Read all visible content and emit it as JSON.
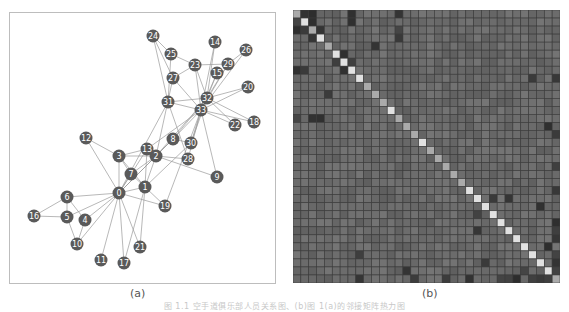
{
  "figure": {
    "caption": "图 1.1  空手道俱乐部人员关系图、(b)图 1(a)的邻接矩阵热力图",
    "panel_a_label": "(a)",
    "panel_b_label": "(b)"
  },
  "colors": {
    "node_fill": "#5a5a5a",
    "node_text": "#ffffff",
    "edge": "#9a9a9a",
    "frame": "#bdbdbd",
    "matrix_base": "#6a6a6a",
    "matrix_grid": "#3c3c3c"
  },
  "network": {
    "node_radius": 6.5,
    "nodes": [
      {
        "id": "0",
        "x": 118,
        "y": 192
      },
      {
        "id": "1",
        "x": 144,
        "y": 186
      },
      {
        "id": "2",
        "x": 155,
        "y": 155
      },
      {
        "id": "3",
        "x": 118,
        "y": 155
      },
      {
        "id": "4",
        "x": 84,
        "y": 219
      },
      {
        "id": "5",
        "x": 66,
        "y": 216
      },
      {
        "id": "6",
        "x": 66,
        "y": 196
      },
      {
        "id": "7",
        "x": 130,
        "y": 173
      },
      {
        "id": "8",
        "x": 172,
        "y": 138
      },
      {
        "id": "9",
        "x": 216,
        "y": 176
      },
      {
        "id": "10",
        "x": 76,
        "y": 243
      },
      {
        "id": "11",
        "x": 100,
        "y": 259
      },
      {
        "id": "12",
        "x": 85,
        "y": 137
      },
      {
        "id": "13",
        "x": 146,
        "y": 148
      },
      {
        "id": "14",
        "x": 214,
        "y": 41
      },
      {
        "id": "15",
        "x": 216,
        "y": 72
      },
      {
        "id": "16",
        "x": 33,
        "y": 215
      },
      {
        "id": "17",
        "x": 123,
        "y": 262
      },
      {
        "id": "18",
        "x": 253,
        "y": 121
      },
      {
        "id": "19",
        "x": 164,
        "y": 205
      },
      {
        "id": "20",
        "x": 247,
        "y": 86
      },
      {
        "id": "21",
        "x": 139,
        "y": 246
      },
      {
        "id": "22",
        "x": 234,
        "y": 124
      },
      {
        "id": "23",
        "x": 194,
        "y": 64
      },
      {
        "id": "24",
        "x": 152,
        "y": 35
      },
      {
        "id": "25",
        "x": 170,
        "y": 53
      },
      {
        "id": "26",
        "x": 245,
        "y": 49
      },
      {
        "id": "27",
        "x": 172,
        "y": 77
      },
      {
        "id": "28",
        "x": 187,
        "y": 158
      },
      {
        "id": "29",
        "x": 227,
        "y": 63
      },
      {
        "id": "30",
        "x": 190,
        "y": 142
      },
      {
        "id": "31",
        "x": 167,
        "y": 101
      },
      {
        "id": "32",
        "x": 206,
        "y": 97
      },
      {
        "id": "33",
        "x": 200,
        "y": 109
      }
    ],
    "edges": [
      [
        0,
        1
      ],
      [
        0,
        2
      ],
      [
        0,
        3
      ],
      [
        0,
        4
      ],
      [
        0,
        5
      ],
      [
        0,
        6
      ],
      [
        0,
        7
      ],
      [
        0,
        8
      ],
      [
        0,
        10
      ],
      [
        0,
        11
      ],
      [
        0,
        12
      ],
      [
        0,
        13
      ],
      [
        0,
        17
      ],
      [
        0,
        19
      ],
      [
        0,
        21
      ],
      [
        0,
        31
      ],
      [
        1,
        2
      ],
      [
        1,
        3
      ],
      [
        1,
        7
      ],
      [
        1,
        13
      ],
      [
        1,
        17
      ],
      [
        1,
        19
      ],
      [
        1,
        21
      ],
      [
        1,
        30
      ],
      [
        2,
        3
      ],
      [
        2,
        7
      ],
      [
        2,
        8
      ],
      [
        2,
        9
      ],
      [
        2,
        13
      ],
      [
        2,
        27
      ],
      [
        2,
        28
      ],
      [
        2,
        32
      ],
      [
        3,
        7
      ],
      [
        3,
        12
      ],
      [
        3,
        13
      ],
      [
        4,
        6
      ],
      [
        4,
        10
      ],
      [
        5,
        6
      ],
      [
        5,
        10
      ],
      [
        5,
        16
      ],
      [
        6,
        16
      ],
      [
        8,
        30
      ],
      [
        8,
        32
      ],
      [
        8,
        33
      ],
      [
        9,
        33
      ],
      [
        13,
        33
      ],
      [
        14,
        32
      ],
      [
        14,
        33
      ],
      [
        15,
        32
      ],
      [
        15,
        33
      ],
      [
        18,
        32
      ],
      [
        18,
        33
      ],
      [
        19,
        33
      ],
      [
        20,
        32
      ],
      [
        20,
        33
      ],
      [
        22,
        32
      ],
      [
        22,
        33
      ],
      [
        23,
        25
      ],
      [
        23,
        27
      ],
      [
        23,
        29
      ],
      [
        23,
        32
      ],
      [
        23,
        33
      ],
      [
        24,
        25
      ],
      [
        24,
        27
      ],
      [
        24,
        31
      ],
      [
        25,
        31
      ],
      [
        26,
        29
      ],
      [
        26,
        33
      ],
      [
        27,
        33
      ],
      [
        28,
        31
      ],
      [
        28,
        33
      ],
      [
        29,
        32
      ],
      [
        29,
        33
      ],
      [
        30,
        32
      ],
      [
        30,
        33
      ],
      [
        31,
        32
      ],
      [
        31,
        33
      ],
      [
        32,
        33
      ]
    ]
  },
  "matrix": {
    "size": 34,
    "note": "heatmap of adjacency/similarity; diagonal bright, community blocks darker",
    "diagonal_bright_indices": [
      1,
      3,
      5,
      6,
      7,
      8,
      12,
      16,
      22,
      23,
      24,
      25,
      26,
      27,
      28,
      29,
      30,
      31,
      32
    ],
    "dark_cells": [
      [
        1,
        0
      ],
      [
        0,
        1
      ],
      [
        2,
        0
      ],
      [
        0,
        2
      ],
      [
        2,
        1
      ],
      [
        1,
        2
      ],
      [
        3,
        2
      ],
      [
        2,
        3
      ],
      [
        0,
        7
      ],
      [
        7,
        0
      ],
      [
        1,
        7
      ],
      [
        7,
        1
      ],
      [
        0,
        13
      ],
      [
        13,
        0
      ],
      [
        5,
        6
      ],
      [
        6,
        5
      ],
      [
        6,
        7
      ],
      [
        7,
        6
      ],
      [
        4,
        10
      ],
      [
        10,
        4
      ],
      [
        2,
        13
      ],
      [
        13,
        2
      ],
      [
        3,
        13
      ],
      [
        13,
        3
      ],
      [
        8,
        30
      ],
      [
        30,
        8
      ],
      [
        23,
        25
      ],
      [
        25,
        23
      ],
      [
        23,
        27
      ],
      [
        27,
        23
      ],
      [
        24,
        31
      ],
      [
        31,
        24
      ],
      [
        29,
        32
      ],
      [
        32,
        29
      ],
      [
        26,
        33
      ],
      [
        33,
        26
      ],
      [
        30,
        33
      ],
      [
        33,
        30
      ],
      [
        31,
        33
      ],
      [
        33,
        31
      ],
      [
        32,
        33
      ],
      [
        33,
        32
      ],
      [
        8,
        33
      ],
      [
        33,
        8
      ],
      [
        28,
        33
      ],
      [
        33,
        28
      ],
      [
        14,
        32
      ],
      [
        32,
        14
      ],
      [
        15,
        33
      ],
      [
        33,
        15
      ],
      [
        22,
        33
      ],
      [
        33,
        22
      ],
      [
        19,
        33
      ],
      [
        33,
        19
      ],
      [
        27,
        33
      ],
      [
        33,
        27
      ]
    ]
  }
}
